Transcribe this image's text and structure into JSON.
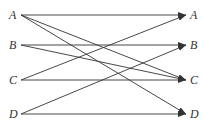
{
  "diagram": {
    "left_nodes": [
      {
        "label": "A",
        "y": 15
      },
      {
        "label": "B",
        "y": 45
      },
      {
        "label": "C",
        "y": 80
      },
      {
        "label": "D",
        "y": 114
      }
    ],
    "right_nodes": [
      {
        "label": "A",
        "y": 15
      },
      {
        "label": "B",
        "y": 45
      },
      {
        "label": "C",
        "y": 80
      },
      {
        "label": "D",
        "y": 114
      }
    ],
    "edges": [
      {
        "from": "A",
        "to": "A"
      },
      {
        "from": "A",
        "to": "C"
      },
      {
        "from": "A",
        "to": "D"
      },
      {
        "from": "B",
        "to": "B"
      },
      {
        "from": "B",
        "to": "C"
      },
      {
        "from": "C",
        "to": "A"
      },
      {
        "from": "C",
        "to": "C"
      },
      {
        "from": "D",
        "to": "B"
      },
      {
        "from": "D",
        "to": "D"
      }
    ],
    "line_color": "#333333"
  }
}
